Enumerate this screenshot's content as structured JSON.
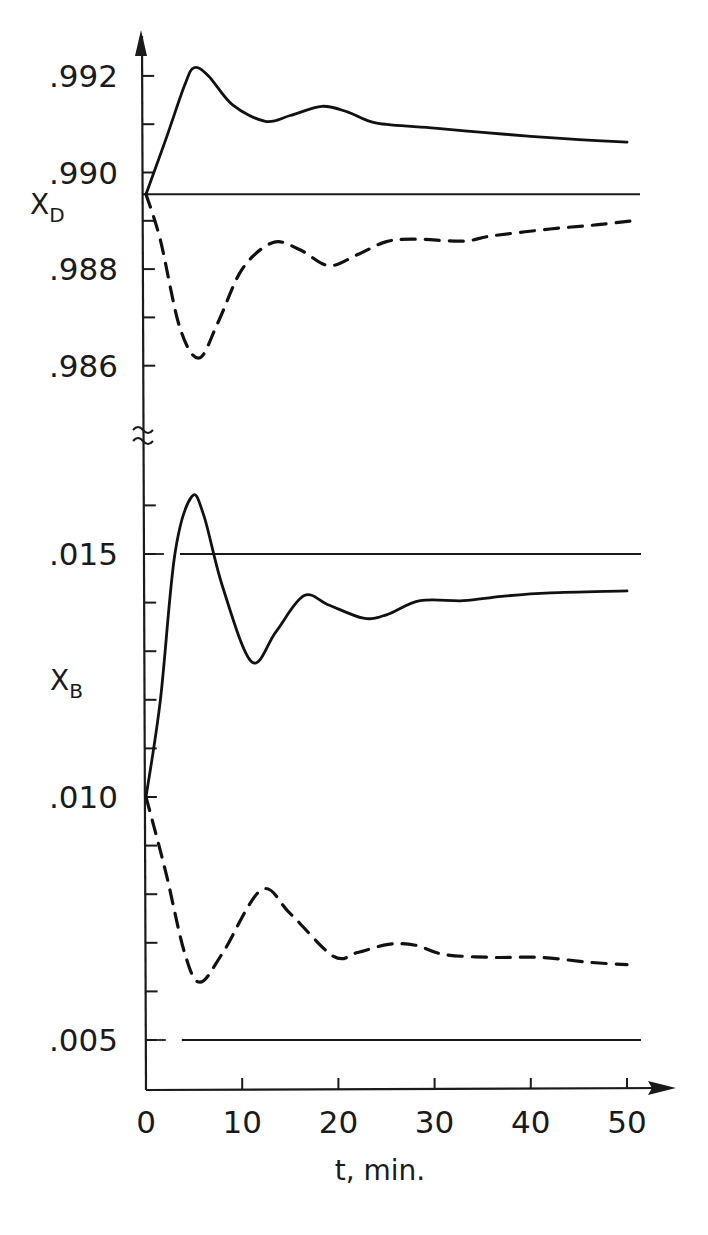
{
  "chart_data": {
    "type": "line",
    "title": "",
    "xlabel": "t, min.",
    "x_ticks": [
      0,
      10,
      20,
      30,
      40,
      50
    ],
    "x_tick_labels": [
      "0",
      "10",
      "20",
      "30",
      "40",
      "50"
    ],
    "xlim": [
      0,
      55
    ],
    "grid": false,
    "legend": "none",
    "panels": [
      {
        "name": "distillate",
        "ylabel": "X",
        "ylabel_sub": "D",
        "ylim": [
          0.9851,
          0.9927
        ],
        "y_ticks": [
          0.986,
          0.987,
          0.988,
          0.989,
          0.99,
          0.991,
          0.992
        ],
        "y_tick_labels": [
          ".986",
          "",
          ".988",
          "",
          ".990",
          "",
          ".992"
        ],
        "reference_lines": [
          {
            "value": 0.98955,
            "style": "solid"
          }
        ],
        "series": [
          {
            "name": "upper-response-solid",
            "style": "solid",
            "x": [
              0,
              2,
              4,
              5,
              6.5,
              9,
              12.4,
              15,
              18.3,
              21,
              24,
              30,
              35,
              40,
              45,
              50
            ],
            "y": [
              0.98955,
              0.99065,
              0.9918,
              0.99217,
              0.992,
              0.9914,
              0.99106,
              0.99118,
              0.99137,
              0.99125,
              0.99102,
              0.99092,
              0.99083,
              0.99075,
              0.99068,
              0.99063
            ]
          },
          {
            "name": "upper-response-dashed",
            "style": "dashed",
            "x": [
              0,
              1.5,
              3.5,
              5.5,
              7.5,
              10,
              13.2,
              16,
              19,
              22,
              25,
              28,
              33,
              36,
              42,
              47,
              51
            ],
            "y": [
              0.98955,
              0.9886,
              0.9868,
              0.98616,
              0.9869,
              0.988,
              0.98855,
              0.9884,
              0.98807,
              0.9883,
              0.98857,
              0.98862,
              0.98858,
              0.98869,
              0.98883,
              0.98892,
              0.98901
            ]
          }
        ]
      },
      {
        "name": "bottoms",
        "ylabel": "X",
        "ylabel_sub": "B",
        "ylim": [
          0.0041,
          0.0172
        ],
        "y_ticks": [
          0.005,
          0.006,
          0.007,
          0.008,
          0.009,
          0.01,
          0.011,
          0.012,
          0.013,
          0.014,
          0.015,
          0.016
        ],
        "y_tick_labels": [
          ".005",
          "",
          "",
          "",
          "",
          ".010",
          "",
          "",
          "",
          "",
          ".015",
          ""
        ],
        "reference_lines": [
          {
            "value": 0.015,
            "style": "solid"
          },
          {
            "value": 0.005,
            "style": "solid"
          }
        ],
        "series": [
          {
            "name": "lower-response-solid",
            "style": "solid",
            "x": [
              0,
              1.5,
              3,
              4.75,
              6,
              8,
              11,
              13.5,
              16.4,
              19,
              22.6,
              25,
              28.5,
              33,
              37,
              42,
              50
            ],
            "y": [
              0.01,
              0.012,
              0.015,
              0.01618,
              0.0158,
              0.0143,
              0.01278,
              0.0134,
              0.01414,
              0.01395,
              0.01368,
              0.01375,
              0.01404,
              0.01404,
              0.01413,
              0.0142,
              0.01424
            ]
          },
          {
            "name": "lower-response-dashed",
            "style": "dashed",
            "x": [
              0,
              2,
              4,
              5.6,
              8,
              12,
              15,
              19.5,
              22,
              25.2,
              28,
              31,
              36,
              41,
              46,
              50
            ],
            "y": [
              0.01,
              0.0085,
              0.0068,
              0.00619,
              0.0068,
              0.00809,
              0.0076,
              0.00672,
              0.0068,
              0.00697,
              0.00695,
              0.00676,
              0.0067,
              0.0067,
              0.0066,
              0.00655
            ]
          }
        ]
      }
    ]
  }
}
